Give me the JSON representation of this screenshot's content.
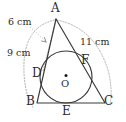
{
  "figure": {
    "type": "geometry-diagram",
    "colors": {
      "stroke": "#3a3a3a",
      "dotted": "#b0a9a9",
      "text": "#2b2b2b",
      "background": "#ffffff"
    }
  },
  "vertices": {
    "a": "A",
    "b": "B",
    "c": "C"
  },
  "tangent_points": {
    "d": "D",
    "e": "E",
    "f": "F"
  },
  "center": {
    "label": "O"
  },
  "dimensions": {
    "ad": "6 cm",
    "ab": "9 cm",
    "ac": "11 cm"
  },
  "geometry": {
    "points": {
      "A": [
        56,
        19
      ],
      "B": [
        37,
        103
      ],
      "C": [
        105,
        103
      ],
      "D": [
        42.5,
        72
      ],
      "E": [
        66,
        103
      ],
      "F": [
        84,
        62
      ],
      "O": [
        66,
        77
      ]
    },
    "incircle": {
      "cx": 66,
      "cy": 77,
      "r": 26
    }
  }
}
